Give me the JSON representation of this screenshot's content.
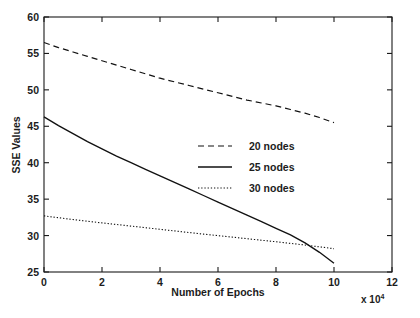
{
  "chart_data": {
    "type": "line",
    "title": "",
    "xlabel": "Number of Epochs",
    "ylabel": "SSE Values",
    "x_multiplier": "x 10",
    "x_multiplier_exponent": "4",
    "xlim": [
      0,
      12
    ],
    "ylim": [
      25,
      60
    ],
    "xticks": [
      0,
      2,
      4,
      6,
      8,
      10,
      12
    ],
    "xticklabels": [
      "0",
      "2",
      "4",
      "6",
      "8",
      "10",
      "12"
    ],
    "yticks": [
      25,
      30,
      35,
      40,
      45,
      50,
      55,
      60
    ],
    "yticklabels": [
      "25",
      "30",
      "35",
      "40",
      "45",
      "50",
      "55",
      "60"
    ],
    "grid": false,
    "legend_position": "center-right-inside",
    "series": [
      {
        "name": "20  nodes",
        "style": "dashed",
        "color": "#111111",
        "x": [
          0,
          0.5,
          1,
          1.5,
          2,
          2.5,
          3,
          3.5,
          4,
          4.5,
          5,
          5.5,
          6,
          6.5,
          7,
          7.5,
          8,
          8.5,
          9,
          9.5,
          10
        ],
        "y": [
          56.5,
          55.8,
          55.2,
          54.6,
          54.0,
          53.4,
          52.8,
          52.2,
          51.6,
          51.1,
          50.6,
          50.1,
          49.6,
          49.1,
          48.6,
          48.2,
          47.8,
          47.3,
          46.8,
          46.2,
          45.5
        ]
      },
      {
        "name": "25  nodes",
        "style": "solid",
        "color": "#111111",
        "x": [
          0,
          0.5,
          1,
          1.5,
          2,
          2.5,
          3,
          3.5,
          4,
          4.5,
          5,
          5.5,
          6,
          6.5,
          7,
          7.5,
          8,
          8.5,
          9,
          9.5,
          10
        ],
        "y": [
          46.3,
          45.1,
          44.0,
          42.9,
          41.9,
          40.9,
          40.0,
          39.1,
          38.2,
          37.3,
          36.4,
          35.5,
          34.6,
          33.7,
          32.8,
          31.9,
          31.0,
          30.1,
          29.0,
          27.7,
          26.2
        ]
      },
      {
        "name": "30  nodes",
        "style": "dotted",
        "color": "#111111",
        "x": [
          0,
          0.5,
          1,
          1.5,
          2,
          2.5,
          3,
          3.5,
          4,
          4.5,
          5,
          5.5,
          6,
          6.5,
          7,
          7.5,
          8,
          8.5,
          9,
          9.5,
          10
        ],
        "y": [
          32.7,
          32.45,
          32.2,
          31.97,
          31.74,
          31.52,
          31.3,
          31.08,
          30.86,
          30.64,
          30.42,
          30.2,
          29.99,
          29.78,
          29.57,
          29.36,
          29.15,
          28.93,
          28.7,
          28.45,
          28.2
        ]
      }
    ],
    "legend": [
      {
        "label": "20  nodes",
        "style": "dashed"
      },
      {
        "label": "25  nodes",
        "style": "solid"
      },
      {
        "label": "30  nodes",
        "style": "dotted"
      }
    ]
  }
}
